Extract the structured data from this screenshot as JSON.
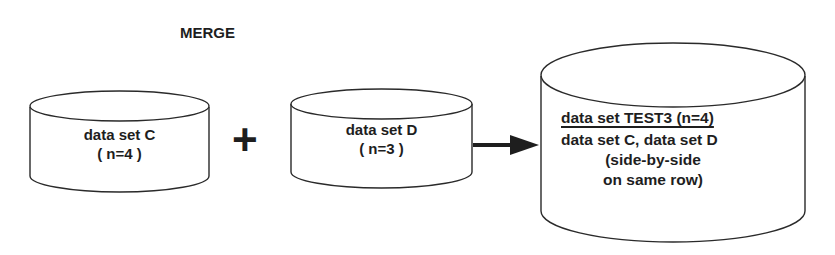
{
  "title": "MERGE",
  "inputs": [
    {
      "name": "data set C",
      "count": "( n=4  )"
    },
    {
      "name": "data set D",
      "count": "( n=3  )"
    }
  ],
  "operator": "+",
  "output": {
    "header": "data set TEST3 (n=4)",
    "lines": [
      "data set C, data set D",
      "(side-by-side",
      "on same row)"
    ]
  },
  "colors": {
    "stroke": "#2a2a2a",
    "background": "#ffffff"
  }
}
